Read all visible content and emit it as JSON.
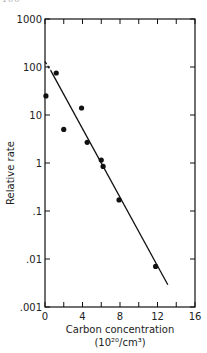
{
  "header": {
    "page_fragment": "100 · · · · · ·"
  },
  "chart_data": {
    "type": "scatter",
    "title": "",
    "xlabel": "Carbon concentration",
    "xlabel_units": "(10²⁰/cm³)",
    "ylabel": "Relative rate",
    "xlim": [
      0,
      16
    ],
    "ylim": [
      0.001,
      1000
    ],
    "yscale": "log",
    "grid": false,
    "x_ticks": [
      0,
      4,
      8,
      12,
      16
    ],
    "x_tick_labels": [
      "0",
      "4",
      "8",
      "12",
      "16"
    ],
    "y_ticks": [
      1000,
      100,
      10,
      1,
      0.1,
      0.01,
      0.001
    ],
    "y_tick_labels": [
      "1000",
      "100",
      "10",
      "1",
      ".1",
      ".01",
      ".001"
    ],
    "points": [
      {
        "x": 0.1,
        "y": 25
      },
      {
        "x": 1.2,
        "y": 75
      },
      {
        "x": 2.0,
        "y": 5
      },
      {
        "x": 3.9,
        "y": 14
      },
      {
        "x": 4.5,
        "y": 2.7
      },
      {
        "x": 6.0,
        "y": 1.15
      },
      {
        "x": 6.2,
        "y": 0.85
      },
      {
        "x": 7.9,
        "y": 0.17
      },
      {
        "x": 11.8,
        "y": 0.007
      }
    ],
    "fit_line": {
      "dashed_segment": [
        {
          "x": 0.0,
          "y": 130
        },
        {
          "x": 0.6,
          "y": 85
        }
      ],
      "solid_segment": [
        {
          "x": 0.6,
          "y": 85
        },
        {
          "x": 13.1,
          "y": 0.0029
        }
      ]
    }
  }
}
